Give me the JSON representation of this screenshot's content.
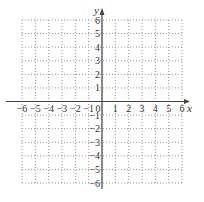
{
  "chart_data": {
    "type": "scatter",
    "title": "",
    "xlabel": "x",
    "ylabel": "y",
    "xlim": [
      -6,
      6
    ],
    "ylim": [
      -6,
      6
    ],
    "grid": true,
    "grid_style": "dotted",
    "x_ticks": [
      -6,
      -5,
      -4,
      -3,
      -2,
      -1,
      0,
      1,
      2,
      3,
      4,
      5,
      6
    ],
    "y_ticks": [
      -6,
      -5,
      -4,
      -3,
      -2,
      -1,
      1,
      2,
      3,
      4,
      5,
      6
    ],
    "x_tick_labels": [
      "−6",
      "−5",
      "−4",
      "−3",
      "−2",
      "−1",
      "0",
      "1",
      "2",
      "3",
      "4",
      "5",
      "6"
    ],
    "y_tick_labels": [
      "−6",
      "−5",
      "−4",
      "−3",
      "−2",
      "−1",
      "1",
      "2",
      "3",
      "4",
      "5",
      "6"
    ],
    "series": []
  },
  "colors": {
    "grid": "#9a9a9a",
    "axis": "#444444",
    "text": "#333333"
  }
}
